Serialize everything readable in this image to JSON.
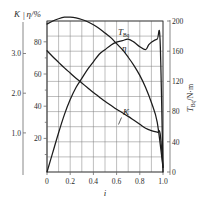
{
  "chart_data": {
    "type": "line",
    "title": "",
    "xlabel": "i",
    "ylabel": "K | η/%",
    "y2label": "T_Bq/N·m",
    "grid": true,
    "legend_position": "inline-labels",
    "x": [
      0,
      0.2,
      0.4,
      0.6,
      0.8,
      1.0
    ],
    "xlim": [
      0,
      1.0
    ],
    "xticklabels": [
      "0",
      "0.2",
      "0.4",
      "0.6",
      "0.8",
      "1.0"
    ],
    "axes": [
      {
        "name": "K",
        "side": "left-outer",
        "label": "K",
        "ticks": [
          1.0,
          2.0,
          3.0
        ],
        "ticklabels": [
          "1.0",
          "2.0",
          "3.0"
        ],
        "lim": [
          0,
          3.8
        ]
      },
      {
        "name": "eta",
        "side": "left-inner",
        "label": "η/%",
        "ticks": [
          20,
          40,
          60,
          80
        ],
        "ticklabels": [
          "20",
          "40",
          "60",
          "80"
        ],
        "lim": [
          0,
          100
        ]
      },
      {
        "name": "T_Bq",
        "side": "right",
        "label": "T_Bq/N·m",
        "ticks": [
          0,
          40,
          80,
          120,
          160,
          200
        ],
        "ticklabels": [
          "0",
          "40",
          "80",
          "120",
          "160",
          "200"
        ],
        "lim": [
          0,
          200
        ]
      }
    ],
    "series": [
      {
        "name": "T_Bq",
        "label": "T_Bq",
        "label_main": "T",
        "label_sub": "Bq",
        "axis": "T_Bq",
        "unit": "N·m",
        "points": [
          [
            0.0,
            196
          ],
          [
            0.05,
            200
          ],
          [
            0.1,
            203
          ],
          [
            0.15,
            205
          ],
          [
            0.2,
            205
          ],
          [
            0.25,
            204
          ],
          [
            0.3,
            202
          ],
          [
            0.35,
            199
          ],
          [
            0.4,
            195
          ],
          [
            0.45,
            190
          ],
          [
            0.5,
            184
          ],
          [
            0.55,
            178
          ],
          [
            0.6,
            170
          ],
          [
            0.65,
            162
          ],
          [
            0.7,
            152
          ],
          [
            0.75,
            141
          ],
          [
            0.8,
            128
          ],
          [
            0.85,
            112
          ],
          [
            0.9,
            92
          ],
          [
            0.95,
            66
          ],
          [
            1.0,
            6
          ]
        ]
      },
      {
        "name": "eta",
        "label": "η",
        "axis": "eta",
        "unit": "%",
        "points": [
          [
            0.0,
            0
          ],
          [
            0.05,
            13
          ],
          [
            0.1,
            26
          ],
          [
            0.15,
            38
          ],
          [
            0.2,
            48
          ],
          [
            0.25,
            56
          ],
          [
            0.3,
            62
          ],
          [
            0.35,
            68
          ],
          [
            0.4,
            73
          ],
          [
            0.45,
            78
          ],
          [
            0.5,
            81
          ],
          [
            0.55,
            84
          ],
          [
            0.6,
            86
          ],
          [
            0.65,
            87
          ],
          [
            0.7,
            88
          ],
          [
            0.75,
            86
          ],
          [
            0.8,
            83
          ],
          [
            0.85,
            81
          ],
          [
            0.875,
            84
          ],
          [
            0.9,
            86
          ],
          [
            0.95,
            88
          ],
          [
            0.975,
            87
          ],
          [
            1.0,
            0
          ]
        ]
      },
      {
        "name": "K",
        "label": "K",
        "axis": "K",
        "unit": "",
        "points": [
          [
            0.0,
            3.05
          ],
          [
            0.05,
            2.9
          ],
          [
            0.1,
            2.76
          ],
          [
            0.15,
            2.62
          ],
          [
            0.2,
            2.49
          ],
          [
            0.25,
            2.36
          ],
          [
            0.3,
            2.24
          ],
          [
            0.35,
            2.12
          ],
          [
            0.4,
            2.0
          ],
          [
            0.45,
            1.89
          ],
          [
            0.5,
            1.78
          ],
          [
            0.55,
            1.68
          ],
          [
            0.6,
            1.58
          ],
          [
            0.65,
            1.49
          ],
          [
            0.7,
            1.4
          ],
          [
            0.75,
            1.3
          ],
          [
            0.8,
            1.2
          ],
          [
            0.85,
            1.1
          ],
          [
            0.9,
            1.04
          ],
          [
            0.95,
            1.0
          ],
          [
            0.975,
            0.97
          ],
          [
            1.0,
            0.12
          ]
        ]
      }
    ],
    "annotations": [
      {
        "name": "label-T",
        "text": "T_Bq",
        "x": 0.62,
        "y_px_hint": "upper-middle"
      },
      {
        "name": "label-eta",
        "text": "η",
        "x": 0.7,
        "y_px_hint": "mid-upper"
      },
      {
        "name": "label-K",
        "text": "K",
        "x": 0.72,
        "y_px_hint": "lower-middle"
      }
    ]
  },
  "labels": {
    "left_outer_axis": "K",
    "left_inner_axis": "η/%",
    "axis_separator": "|",
    "right_axis_main": "T",
    "right_axis_sub": "Bq",
    "right_axis_unit": "/N·m",
    "x_axis": "i",
    "curve_T_main": "T",
    "curve_T_sub": "Bq",
    "curve_eta": "η",
    "curve_K": "K"
  },
  "ticks": {
    "k": [
      "3.0",
      "2.0",
      "1.0"
    ],
    "eta": [
      "80",
      "60",
      "40",
      "20"
    ],
    "t": [
      "200",
      "160",
      "120",
      "80",
      "40",
      "0"
    ],
    "x": [
      "0",
      "0.2",
      "0.4",
      "0.6",
      "0.8",
      "1.0"
    ]
  },
  "colors": {
    "curve": "#1c1c1c",
    "grid": "#7d7d7d",
    "axis": "#6a6a6a",
    "frame": "#3a3a3a",
    "background": "#ffffff"
  }
}
